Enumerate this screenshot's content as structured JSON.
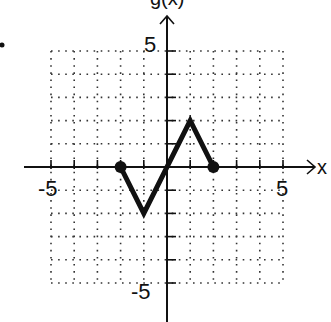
{
  "chart_data": {
    "type": "line",
    "title": "",
    "xlabel": "x",
    "ylabel": "g(x)",
    "xlim": [
      -5,
      5
    ],
    "ylim": [
      -5,
      5
    ],
    "grid": true,
    "grid_style": "dotted",
    "x_tick_labels": [
      "-5",
      "5"
    ],
    "y_tick_labels": [
      "5",
      "-5"
    ],
    "series": [
      {
        "name": "g(x)",
        "x": [
          -2,
          -1,
          1,
          2
        ],
        "y": [
          0,
          -2,
          2,
          0
        ],
        "endpoints": "closed"
      }
    ],
    "colors": {
      "line": "#111111",
      "grid": "#333333",
      "axis": "#111111"
    }
  },
  "labels": {
    "x_axis": "x",
    "y_axis": "g(x)",
    "x_neg": "-5",
    "x_pos": "5",
    "y_pos": "5",
    "y_neg": "-5"
  }
}
